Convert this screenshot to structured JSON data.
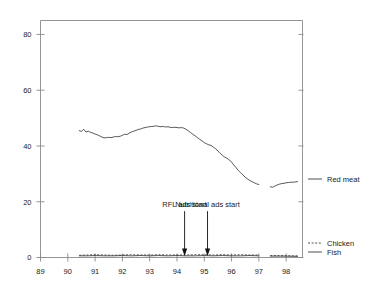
{
  "chart_data": {
    "type": "line",
    "title": "",
    "subtitle": "",
    "xlabel": "",
    "ylabel": "",
    "xlim": [
      89.0,
      98.6
    ],
    "ylim": [
      0,
      85
    ],
    "grid": false,
    "legend_position": "right",
    "x_ticks": [
      "89",
      "90",
      "91",
      "92",
      "93",
      "94",
      "95",
      "96",
      "97",
      "98"
    ],
    "x_tick_values": [
      89,
      90,
      91,
      92,
      93,
      94,
      95,
      96,
      97,
      98
    ],
    "y_ticks": [
      "0",
      "20",
      "40",
      "60",
      "80"
    ],
    "y_tick_values": [
      0,
      20,
      40,
      60,
      80
    ],
    "series": [
      {
        "name": "Red meat",
        "style": "solid",
        "color": "#3a3a3a",
        "x": [
          90.42,
          90.5,
          90.58,
          90.67,
          90.75,
          90.83,
          90.92,
          91.0,
          91.08,
          91.17,
          91.25,
          91.33,
          91.42,
          91.5,
          91.58,
          91.67,
          91.75,
          91.83,
          91.92,
          92.0,
          92.08,
          92.17,
          92.25,
          92.33,
          92.42,
          92.5,
          92.58,
          92.67,
          92.75,
          92.83,
          92.92,
          93.0,
          93.08,
          93.17,
          93.25,
          93.33,
          93.42,
          93.5,
          93.58,
          93.67,
          93.75,
          93.83,
          93.92,
          94.0,
          94.08,
          94.17,
          94.25,
          94.33,
          94.42,
          94.5,
          94.58,
          94.67,
          94.75,
          94.83,
          94.92,
          95.0,
          95.08,
          95.17,
          95.25,
          95.33,
          95.42,
          95.5,
          95.58,
          95.67,
          95.75,
          95.83,
          95.92,
          96.0,
          96.08,
          96.17,
          96.25,
          96.33,
          96.42,
          96.5,
          96.58,
          96.67,
          96.75,
          96.83,
          96.92,
          97.0
        ],
        "values": [
          45.5,
          45.2,
          46.0,
          45.0,
          45.3,
          44.9,
          44.6,
          44.3,
          44.0,
          43.6,
          43.2,
          42.9,
          43.0,
          43.1,
          43.0,
          43.2,
          43.4,
          43.3,
          43.5,
          43.8,
          44.2,
          44.1,
          44.6,
          45.0,
          45.3,
          45.6,
          45.9,
          46.1,
          46.4,
          46.6,
          46.8,
          46.9,
          47.0,
          47.1,
          47.2,
          47.0,
          46.9,
          47.0,
          46.8,
          46.9,
          46.7,
          46.6,
          46.7,
          46.6,
          46.5,
          46.6,
          46.4,
          46.0,
          45.4,
          44.8,
          44.2,
          43.6,
          43.0,
          42.4,
          41.8,
          41.2,
          40.8,
          40.4,
          40.2,
          39.6,
          39.0,
          38.2,
          37.4,
          36.6,
          36.0,
          35.6,
          35.0,
          34.2,
          33.2,
          32.2,
          31.2,
          30.4,
          29.6,
          28.8,
          28.2,
          27.6,
          27.2,
          26.8,
          26.4,
          26.2
        ],
        "segment2_x": [
          97.42,
          97.5,
          97.58,
          97.67,
          97.75,
          97.83,
          97.92,
          98.0,
          98.08,
          98.17,
          98.25,
          98.33,
          98.42
        ],
        "segment2_values": [
          25.4,
          25.2,
          25.6,
          26.0,
          26.3,
          26.5,
          26.6,
          26.8,
          26.9,
          27.0,
          27.0,
          27.1,
          27.2
        ]
      },
      {
        "name": "Chicken",
        "style": "dashed",
        "color": "#3a3a3a",
        "x": [
          90.42,
          90.75,
          91.0,
          91.33,
          91.67,
          92.0,
          92.33,
          92.67,
          93.0,
          93.33,
          93.67,
          94.0,
          94.33,
          94.67,
          95.0,
          95.33,
          95.67,
          96.0,
          96.33,
          96.67,
          97.0
        ],
        "values": [
          0.8,
          0.9,
          1.0,
          0.9,
          0.8,
          0.9,
          1.0,
          0.9,
          0.9,
          1.0,
          0.9,
          0.9,
          0.9,
          1.0,
          1.0,
          0.9,
          1.0,
          0.9,
          1.0,
          0.9,
          0.9
        ],
        "segment2_x": [
          97.42,
          97.75,
          98.0,
          98.42
        ],
        "segment2_values": [
          0.7,
          0.7,
          0.6,
          0.6
        ]
      },
      {
        "name": "Fish",
        "style": "solid",
        "color": "#3a3a3a",
        "x": [
          90.42,
          90.75,
          91.0,
          91.33,
          91.67,
          92.0,
          92.33,
          92.67,
          93.0,
          93.33,
          93.67,
          94.0,
          94.33,
          94.67,
          95.0,
          95.33,
          95.67,
          96.0,
          96.33,
          96.67,
          97.0
        ],
        "values": [
          0.6,
          0.6,
          0.7,
          0.6,
          0.6,
          0.7,
          0.6,
          0.7,
          0.6,
          0.7,
          0.6,
          0.7,
          0.6,
          0.6,
          0.7,
          0.6,
          0.7,
          0.6,
          0.6,
          0.7,
          0.6
        ],
        "segment2_x": [
          97.42,
          97.75,
          98.0,
          98.42
        ],
        "segment2_values": [
          0.5,
          0.5,
          0.5,
          0.4
        ]
      }
    ],
    "annotations": [
      {
        "label": "RFL ads start",
        "x": 94.28,
        "y": 0,
        "text_y": 17,
        "arrow": "down"
      },
      {
        "label": "Nutritional ads start",
        "x": 95.12,
        "y": 0,
        "text_y": 17,
        "arrow": "down"
      }
    ]
  },
  "legend": {
    "items": [
      {
        "label": "Red meat",
        "style": "solid"
      },
      {
        "label": "Chicken",
        "style": "dashed"
      },
      {
        "label": "Fish",
        "style": "solid"
      }
    ]
  },
  "colors": {
    "line": "#3a3a3a",
    "frame": "#8a8a8a",
    "text": "#222222",
    "background": "#ffffff",
    "annotation": "#111111"
  }
}
